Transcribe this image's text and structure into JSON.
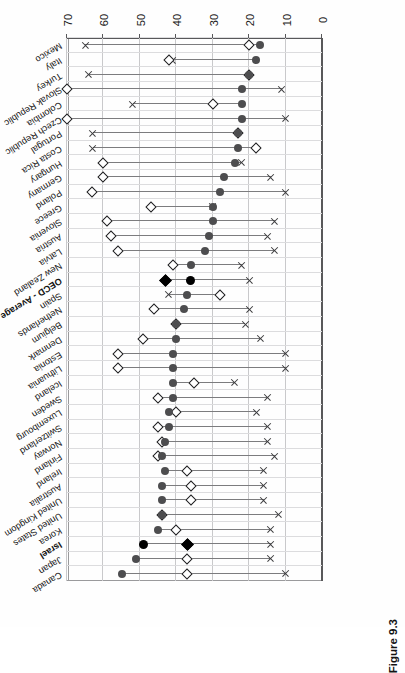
{
  "figure": {
    "caption": "Figure 9.3"
  },
  "chart_data": {
    "type": "scatter",
    "title": "",
    "xlabel": "",
    "ylabel": "",
    "xlim": [
      0,
      70
    ],
    "xticks": [
      "0",
      "10",
      "20",
      "30",
      "40",
      "50",
      "60",
      "70"
    ],
    "grid": true,
    "orientation": "horizontal-rows, page printed upside-down (180°)",
    "legend_position": "none",
    "series": [
      {
        "name": "circle",
        "marker": "filled-circle"
      },
      {
        "name": "diamond",
        "marker": "open-diamond"
      },
      {
        "name": "cross",
        "marker": "x-mark"
      }
    ],
    "categories": [
      "Canada",
      "Japan",
      "Israel",
      "Korea",
      "United States",
      "United Kingdom",
      "Australia",
      "Ireland",
      "Finland",
      "Norway",
      "Switzerland",
      "Luxembourg",
      "Sweden",
      "Iceland",
      "Lithuania",
      "Estonia",
      "Denmark",
      "Belgium",
      "Netherlands",
      "Spain",
      "OECD - Average",
      "New Zealand",
      "Latvia",
      "Austria",
      "Slovenia",
      "Greece",
      "Poland",
      "Germany",
      "Hungary",
      "Costa Rica",
      "Portugal",
      "Czech Republic",
      "Colombia",
      "Slovak Republic",
      "Turkey",
      "Italy",
      "Mexico"
    ],
    "rows": [
      {
        "label": "Canada",
        "circle": 55,
        "diamond": 37,
        "cross": 10,
        "highlight": false
      },
      {
        "label": "Japan",
        "circle": 51,
        "diamond": 37,
        "cross": 14,
        "highlight": false
      },
      {
        "label": "Israel",
        "circle": 49,
        "diamond": 37,
        "cross": 14,
        "highlight": true
      },
      {
        "label": "Korea",
        "circle": 45,
        "diamond": 40,
        "cross": 14,
        "highlight": false
      },
      {
        "label": "United States",
        "circle": 44,
        "diamond": 44,
        "cross": 12,
        "highlight": false
      },
      {
        "label": "United Kingdom",
        "circle": 44,
        "diamond": 36,
        "cross": 16,
        "highlight": false
      },
      {
        "label": "Australia",
        "circle": 44,
        "diamond": 36,
        "cross": 16,
        "highlight": false
      },
      {
        "label": "Ireland",
        "circle": 43,
        "diamond": 37,
        "cross": 16,
        "highlight": false
      },
      {
        "label": "Finland",
        "circle": 44,
        "diamond": 45,
        "cross": 13,
        "highlight": false
      },
      {
        "label": "Norway",
        "circle": 43,
        "diamond": 44,
        "cross": 15,
        "highlight": false
      },
      {
        "label": "Switzerland",
        "circle": 42,
        "diamond": 45,
        "cross": 15,
        "highlight": false
      },
      {
        "label": "Luxembourg",
        "circle": 42,
        "diamond": 40,
        "cross": 18,
        "highlight": false
      },
      {
        "label": "Sweden",
        "circle": 41,
        "diamond": 45,
        "cross": 15,
        "highlight": false
      },
      {
        "label": "Iceland",
        "circle": 41,
        "diamond": 35,
        "cross": 24,
        "highlight": false
      },
      {
        "label": "Lithuania",
        "circle": 41,
        "diamond": 56,
        "cross": 10,
        "highlight": false
      },
      {
        "label": "Estonia",
        "circle": 41,
        "diamond": 56,
        "cross": 10,
        "highlight": false
      },
      {
        "label": "Denmark",
        "circle": 40,
        "diamond": 49,
        "cross": 17,
        "highlight": false
      },
      {
        "label": "Belgium",
        "circle": 40,
        "diamond": 40,
        "cross": 21,
        "highlight": false
      },
      {
        "label": "Netherlands",
        "circle": 38,
        "diamond": 46,
        "cross": 20,
        "highlight": false
      },
      {
        "label": "Spain",
        "circle": 37,
        "diamond": 28,
        "cross": 42,
        "highlight": false
      },
      {
        "label": "OECD - Average",
        "circle": 36,
        "diamond": 43,
        "cross": 20,
        "highlight": true
      },
      {
        "label": "New Zealand",
        "circle": 36,
        "diamond": 41,
        "cross": 22,
        "highlight": false
      },
      {
        "label": "Latvia",
        "circle": 32,
        "diamond": 56,
        "cross": 13,
        "highlight": false
      },
      {
        "label": "Austria",
        "circle": 31,
        "diamond": 58,
        "cross": 15,
        "highlight": false
      },
      {
        "label": "Slovenia",
        "circle": 30,
        "diamond": 59,
        "cross": 13,
        "highlight": false
      },
      {
        "label": "Greece",
        "circle": 30,
        "diamond": 47,
        "cross": 30,
        "highlight": false
      },
      {
        "label": "Poland",
        "circle": 28,
        "diamond": 63,
        "cross": 10,
        "highlight": false
      },
      {
        "label": "Germany",
        "circle": 27,
        "diamond": 60,
        "cross": 14,
        "highlight": false
      },
      {
        "label": "Hungary",
        "circle": 24,
        "diamond": 60,
        "cross": 22,
        "highlight": false
      },
      {
        "label": "Costa Rica",
        "circle": 23,
        "diamond": 18,
        "cross": 63,
        "highlight": false
      },
      {
        "label": "Portugal",
        "circle": 23,
        "diamond": 23,
        "cross": 63,
        "highlight": false
      },
      {
        "label": "Czech Republic",
        "circle": 22,
        "diamond": 70,
        "cross": 10,
        "highlight": false
      },
      {
        "label": "Colombia",
        "circle": 22,
        "diamond": 30,
        "cross": 52,
        "highlight": false
      },
      {
        "label": "Slovak Republic",
        "circle": 22,
        "diamond": 70,
        "cross": 11,
        "highlight": false
      },
      {
        "label": "Turkey",
        "circle": 20,
        "diamond": 20,
        "cross": 64,
        "highlight": false
      },
      {
        "label": "Italy",
        "circle": 18,
        "diamond": 42,
        "cross": 41,
        "highlight": false
      },
      {
        "label": "Mexico",
        "circle": 17,
        "diamond": 20,
        "cross": 65,
        "highlight": false
      }
    ]
  }
}
